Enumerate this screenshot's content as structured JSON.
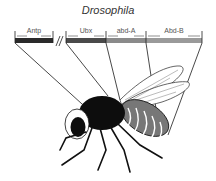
{
  "title": "Drosophila",
  "genes": [
    {
      "label": "Antp",
      "x1": 15,
      "x2": 53,
      "color": "#2a2a2a"
    },
    {
      "label": "Ubx",
      "x1": 66,
      "x2": 106,
      "color": "#4a4a4a"
    },
    {
      "label": "abd-A",
      "x1": 106,
      "x2": 146,
      "color": "#8a8a8a"
    },
    {
      "label": "Abd-B",
      "x1": 146,
      "x2": 202,
      "color": "#9a9a9a"
    }
  ],
  "colors": {
    "line": "#1a1a1a",
    "body": "#0d0d0d",
    "abdomen": "#777777",
    "wing": "#ffffff"
  }
}
